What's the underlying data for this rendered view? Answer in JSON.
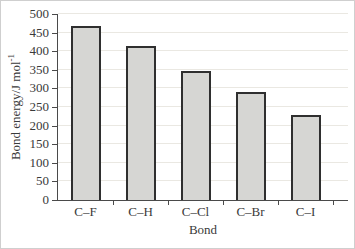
{
  "figure": {
    "y_axis_title_base": "Bond energy/J mol",
    "y_axis_title_exponent": "-1",
    "x_axis_title": "Bond"
  },
  "chart_data": {
    "type": "bar",
    "title": "",
    "xlabel": "Bond",
    "ylabel": "Bond energy/J mol⁻¹",
    "categories": [
      "C–F",
      "C–H",
      "C–Cl",
      "C–Br",
      "C–I"
    ],
    "values": [
      467,
      413,
      346,
      290,
      228
    ],
    "ylim": [
      0,
      500
    ],
    "y_tick_step": 50,
    "y_ticks": [
      0,
      50,
      100,
      150,
      200,
      250,
      300,
      350,
      400,
      450,
      500
    ],
    "grid": "horizontal",
    "legend": "none",
    "colors": {
      "bar_fill": "#d6d6d3",
      "bar_border": "#2f2f2f",
      "grid_color": "#eae8e2",
      "axis_color": "#4a4a4a",
      "text_color": "#3a3a3a",
      "background": "#ffffff"
    }
  }
}
